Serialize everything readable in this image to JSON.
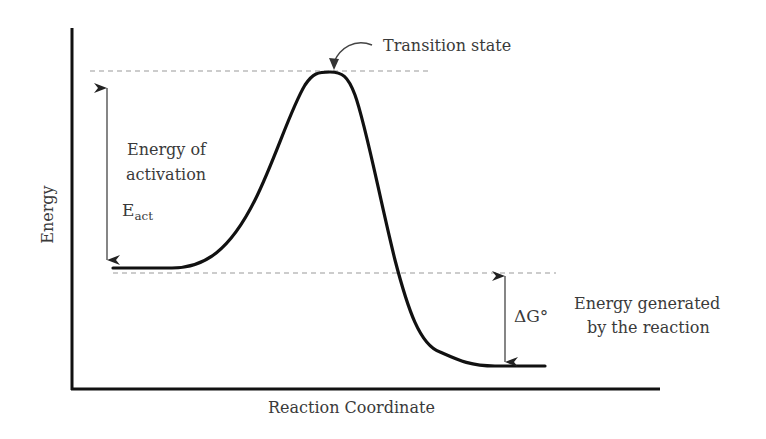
{
  "diagram": {
    "type": "reaction-energy-profile",
    "x_axis_label": "Reaction Coordinate",
    "y_axis_label": "Energy",
    "annotations": {
      "transition_state": "Transition state",
      "activation_line1": "Energy of",
      "activation_line2": "activation",
      "eact_main": "E",
      "eact_sub": "act",
      "delta_g": "ΔG°",
      "generated_line1": "Energy generated",
      "generated_line2": "by the reaction"
    },
    "colors": {
      "curve": "#111111",
      "axes": "#111111",
      "dashed": "#999999",
      "text": "#3a3a3a"
    }
  }
}
